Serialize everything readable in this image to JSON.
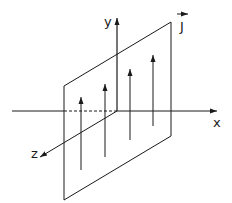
{
  "diagram": {
    "title": "",
    "labels": {
      "y_axis": "y",
      "x_axis": "x",
      "z_axis": "z",
      "current": "J"
    },
    "colors": {
      "line": "#1a1a1a",
      "background": "#ffffff"
    },
    "current_arrows_count": 4
  }
}
